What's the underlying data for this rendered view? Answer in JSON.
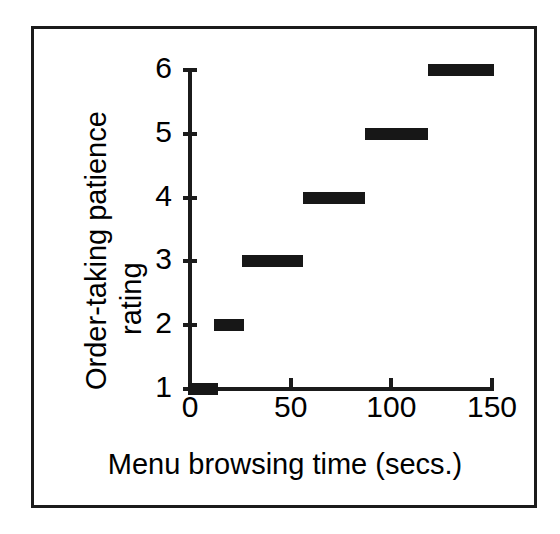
{
  "chart_data": {
    "type": "line",
    "subtype": "step",
    "title": "",
    "xlabel": "Menu browsing time (secs.)",
    "ylabel": "Order-taking patience rating",
    "ylabel_lines": [
      "Order-taking patience",
      "rating"
    ],
    "xlim": [
      0,
      150
    ],
    "ylim": [
      1,
      6
    ],
    "xticks": [
      0,
      50,
      100,
      150
    ],
    "xtick_labels": [
      "0",
      "50",
      "100",
      "150"
    ],
    "yticks": [
      1,
      2,
      3,
      4,
      5,
      6
    ],
    "ytick_labels": [
      "1",
      "2",
      "3",
      "4",
      "5",
      "6"
    ],
    "grid": false,
    "legend": false,
    "series_color": "#171717",
    "axis_color": "#1b1b1b",
    "frame_color": "#1b1b1b",
    "background": "#ffffff",
    "segments": [
      {
        "rating": 1,
        "x_start": 0,
        "x_end": 15,
        "label": "1"
      },
      {
        "rating": 2,
        "x_start": 13,
        "x_end": 28,
        "label": "2"
      },
      {
        "rating": 3,
        "x_start": 27,
        "x_end": 57,
        "label": "3"
      },
      {
        "rating": 4,
        "x_start": 57,
        "x_end": 88,
        "label": "4"
      },
      {
        "rating": 5,
        "x_start": 88,
        "x_end": 119,
        "label": "5"
      },
      {
        "rating": 6,
        "x_start": 119,
        "x_end": 152,
        "label": "6"
      }
    ],
    "categories": [
      "1",
      "2",
      "3",
      "4",
      "5",
      "6"
    ],
    "values": [
      1,
      2,
      3,
      4,
      5,
      6
    ],
    "x": [
      7.5,
      20.5,
      42,
      72.5,
      103.5,
      135.5
    ]
  }
}
